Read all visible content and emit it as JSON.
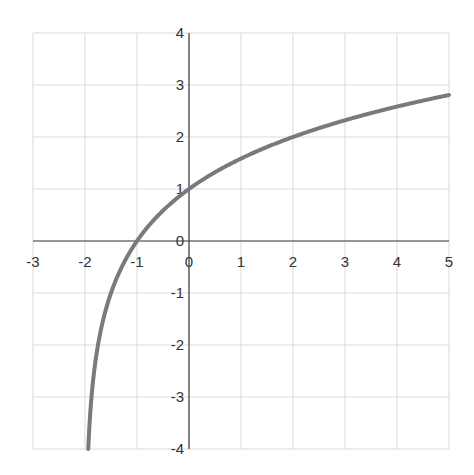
{
  "chart_data": {
    "type": "line",
    "title": "",
    "xlabel": "",
    "ylabel": "",
    "function": "y = log2(x + 2)",
    "xlim": [
      -3,
      5
    ],
    "ylim": [
      -4,
      4
    ],
    "grid": true,
    "legend": null,
    "x_ticks": [
      "-3",
      "-2",
      "-1",
      "0",
      "1",
      "2",
      "3",
      "4",
      "5"
    ],
    "y_ticks": [
      "4",
      "3",
      "2",
      "1",
      "0",
      "-1",
      "-2",
      "-3",
      "-4"
    ],
    "series": [
      {
        "name": "curve",
        "color": "#7a7a7a",
        "x": [
          -1.9375,
          -1.875,
          -1.75,
          -1.5,
          -1.25,
          -1,
          -0.5,
          0,
          0.5,
          1,
          1.5,
          2,
          2.5,
          3,
          3.5,
          4,
          4.5,
          5
        ],
        "y": [
          -4,
          -3,
          -2,
          -1,
          -0.415,
          0,
          0.585,
          1,
          1.322,
          1.585,
          1.807,
          2,
          2.17,
          2.322,
          2.459,
          2.585,
          2.7,
          2.807
        ]
      }
    ]
  },
  "colors": {
    "grid": "#d9d9d9",
    "axis": "#404040",
    "curve": "#7a7a7a",
    "text": "#333333"
  }
}
